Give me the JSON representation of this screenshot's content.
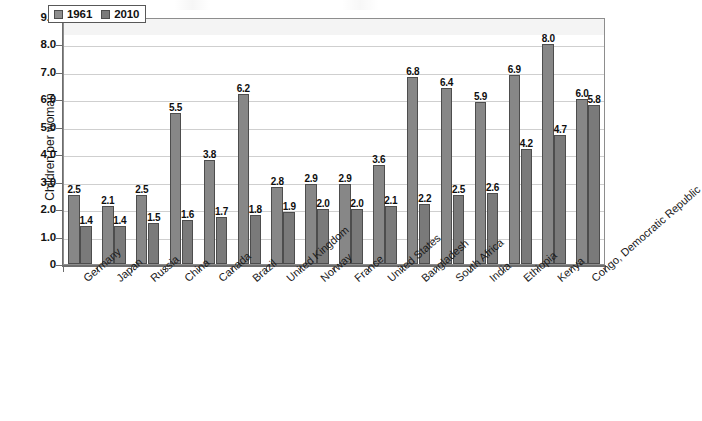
{
  "chart_data": {
    "type": "bar",
    "title": "",
    "subtitle": "",
    "xlabel": "",
    "ylabel": "Children per woman",
    "ylim": [
      0,
      9.0
    ],
    "ytick_labels": [
      "9.0",
      "8.0",
      "7.0",
      "6.0",
      "5.0",
      "4.0",
      "3.0",
      "2.0",
      "1.0",
      "0"
    ],
    "ytick_values": [
      9,
      8,
      7,
      6,
      5,
      4,
      3,
      2,
      1,
      0
    ],
    "grid": true,
    "legend_position": "top-left-inside",
    "categories": [
      "Germany",
      "Japan",
      "Russia",
      "China",
      "Canada",
      "Brazil",
      "United Kingdom",
      "Norway",
      "France",
      "United States",
      "Bangladesh",
      "South Africa",
      "India",
      "Ethiopia",
      "Kenya",
      "Congo, Democratic Republic"
    ],
    "series": [
      {
        "name": "1961",
        "color": "#878787",
        "values": [
          2.5,
          2.1,
          2.5,
          5.5,
          3.8,
          6.2,
          2.8,
          2.9,
          2.9,
          3.6,
          6.8,
          6.4,
          5.9,
          6.9,
          8.0,
          6.0
        ],
        "labels": [
          "2.5",
          "2.1",
          "2.5",
          "5.5",
          "3.8",
          "6.2",
          "2.8",
          "2.9",
          "2.9",
          "3.6",
          "6.8",
          "6.4",
          "5.9",
          "6.9",
          "8.0",
          "6.0"
        ]
      },
      {
        "name": "2010",
        "color": "#7a7a7a",
        "values": [
          1.4,
          1.4,
          1.5,
          1.6,
          1.7,
          1.8,
          1.9,
          2.0,
          2.0,
          2.1,
          2.2,
          2.5,
          2.6,
          4.2,
          4.7,
          5.8
        ],
        "labels": [
          "1.4",
          "1.4",
          "1.5",
          "1.6",
          "1.7",
          "1.8",
          "1.9",
          "2.0",
          "2.0",
          "2.1",
          "2.2",
          "2.5",
          "2.6",
          "4.2",
          "4.7",
          "5.8"
        ]
      }
    ]
  },
  "legend": {
    "items": [
      {
        "label": "1961",
        "swatch": "legend-swatch-1961"
      },
      {
        "label": "2010",
        "swatch": "legend-swatch-2010"
      }
    ]
  },
  "axes": {
    "y_title": "Children per woman"
  }
}
